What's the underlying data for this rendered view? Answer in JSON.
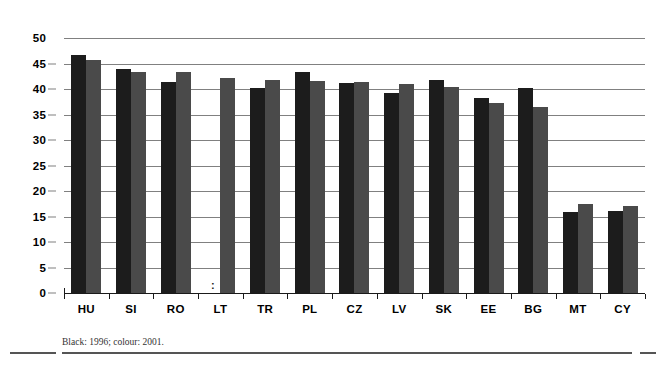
{
  "chart_data": {
    "type": "bar",
    "title": "",
    "subtitle": "",
    "xlabel": "",
    "ylabel": "",
    "ylim": [
      0,
      50
    ],
    "yticks": [
      0,
      5,
      10,
      15,
      20,
      25,
      30,
      35,
      40,
      45,
      50
    ],
    "grid": true,
    "legend_position": "below-as-footnote",
    "categories": [
      "HU",
      "SI",
      "RO",
      "LT",
      "TR",
      "PL",
      "CZ",
      "LV",
      "SK",
      "EE",
      "BG",
      "MT",
      "CY"
    ],
    "series": [
      {
        "name": "1996",
        "color": "#1c1c1c",
        "style": "black",
        "values": [
          46.6,
          44.0,
          41.3,
          null,
          40.2,
          43.4,
          41.1,
          39.3,
          41.8,
          38.2,
          40.2,
          15.8,
          16.0
        ]
      },
      {
        "name": "2001",
        "color": "#4a4a4a",
        "style": "colour",
        "values": [
          45.6,
          43.4,
          43.4,
          42.2,
          41.8,
          41.6,
          41.3,
          41.0,
          40.4,
          37.3,
          36.5,
          17.5,
          17.0
        ]
      }
    ],
    "missing_marker": ":",
    "missing_cells": [
      {
        "category": "LT",
        "series": "1996"
      }
    ],
    "annotations": [
      "Black: 1996; colour: 2001."
    ]
  },
  "footnote": {
    "text": "Black: 1996; colour: 2001."
  },
  "colors": {
    "series_1996": "#1c1c1c",
    "series_2001": "#4a4a4a",
    "gridline": "#808080",
    "axis": "#1a1a1a",
    "background": "#ffffff"
  }
}
